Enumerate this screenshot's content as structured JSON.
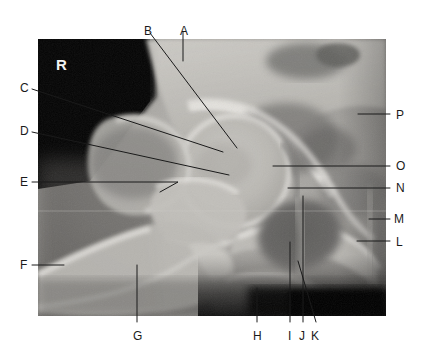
{
  "figure": {
    "side_marker": "R",
    "modality": "x-ray",
    "frame": {
      "x": 38,
      "y": 39,
      "width": 348,
      "height": 277
    }
  },
  "labels": [
    {
      "key": "A",
      "text": "A",
      "x": 180,
      "y": 25,
      "anchor": "top",
      "leader": {
        "type": "line",
        "points": [
          [
            183,
            32
          ],
          [
            183,
            61
          ]
        ]
      }
    },
    {
      "key": "B",
      "text": "B",
      "x": 144,
      "y": 25,
      "anchor": "top",
      "leader": {
        "type": "line",
        "points": [
          [
            150,
            33
          ],
          [
            237,
            148
          ]
        ]
      }
    },
    {
      "key": "C",
      "text": "C",
      "x": 20,
      "y": 82,
      "anchor": "left",
      "leader": {
        "type": "line",
        "points": [
          [
            32,
            89
          ],
          [
            223,
            152
          ]
        ]
      }
    },
    {
      "key": "D",
      "text": "D",
      "x": 20,
      "y": 125,
      "anchor": "left",
      "leader": {
        "type": "line",
        "points": [
          [
            32,
            132
          ],
          [
            229,
            175
          ]
        ]
      }
    },
    {
      "key": "E",
      "text": "E",
      "x": 20,
      "y": 176,
      "anchor": "left",
      "leader": {
        "type": "hook",
        "points": [
          [
            32,
            182
          ],
          [
            178,
            182
          ],
          [
            160,
            192
          ]
        ]
      }
    },
    {
      "key": "F",
      "text": "F",
      "x": 20,
      "y": 259,
      "anchor": "left",
      "leader": {
        "type": "line",
        "points": [
          [
            32,
            265
          ],
          [
            64,
            265
          ]
        ]
      }
    },
    {
      "key": "G",
      "text": "G",
      "x": 133,
      "y": 330,
      "anchor": "bottom",
      "leader": {
        "type": "line",
        "points": [
          [
            137,
            265
          ],
          [
            137,
            322
          ]
        ]
      }
    },
    {
      "key": "H",
      "text": "H",
      "x": 253,
      "y": 330,
      "anchor": "bottom",
      "leader": {
        "type": "line",
        "points": [
          [
            257,
            288
          ],
          [
            257,
            322
          ]
        ]
      }
    },
    {
      "key": "I",
      "text": "I",
      "x": 288,
      "y": 330,
      "anchor": "bottom",
      "leader": {
        "type": "line",
        "points": [
          [
            290,
            242
          ],
          [
            290,
            322
          ]
        ]
      }
    },
    {
      "key": "J",
      "text": "J",
      "x": 299,
      "y": 330,
      "anchor": "bottom",
      "leader": {
        "type": "line",
        "points": [
          [
            303,
            196
          ],
          [
            303,
            322
          ]
        ]
      }
    },
    {
      "key": "K",
      "text": "K",
      "x": 311,
      "y": 330,
      "anchor": "bottom",
      "leader": {
        "type": "line",
        "points": [
          [
            298,
            261
          ],
          [
            316,
            322
          ]
        ]
      }
    },
    {
      "key": "L",
      "text": "L",
      "x": 396,
      "y": 236,
      "anchor": "right",
      "leader": {
        "type": "line",
        "points": [
          [
            357,
            241
          ],
          [
            390,
            241
          ]
        ]
      }
    },
    {
      "key": "M",
      "text": "M",
      "x": 394,
      "y": 213,
      "anchor": "right",
      "leader": {
        "type": "line",
        "points": [
          [
            369,
            219
          ],
          [
            390,
            219
          ]
        ]
      }
    },
    {
      "key": "N",
      "text": "N",
      "x": 396,
      "y": 182,
      "anchor": "right",
      "leader": {
        "type": "line",
        "points": [
          [
            288,
            188
          ],
          [
            390,
            188
          ]
        ]
      }
    },
    {
      "key": "O",
      "text": "O",
      "x": 396,
      "y": 160,
      "anchor": "right",
      "leader": {
        "type": "line",
        "points": [
          [
            273,
            166
          ],
          [
            390,
            166
          ]
        ]
      }
    },
    {
      "key": "P",
      "text": "P",
      "x": 396,
      "y": 109,
      "anchor": "right",
      "leader": {
        "type": "line",
        "points": [
          [
            358,
            114
          ],
          [
            390,
            114
          ]
        ]
      }
    }
  ],
  "colors": {
    "background": "#ffffff",
    "leader_line": "#1a1a1a",
    "label_text": "#1a1a1a",
    "side_marker": "#f2f2f2",
    "film_dark": "#070707",
    "film_mid": "#8f8f8f",
    "bone_bright": "#d8d6d2"
  }
}
